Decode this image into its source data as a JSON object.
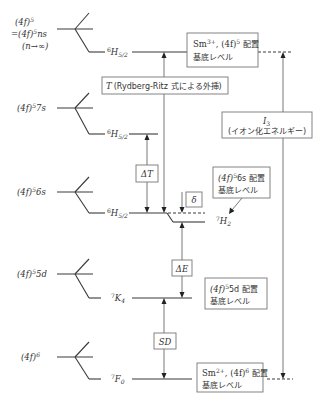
{
  "configs": {
    "limit": {
      "l1_base": "(4f)",
      "l1_sup": "5",
      "l2_base": "=(4f)",
      "l2_sup": "5",
      "l2_suffix": "ns",
      "l3": "(n→∞)"
    },
    "s7": {
      "base": "(4f)",
      "sup": "5",
      "suffix": "7s"
    },
    "s6": {
      "base": "(4f)",
      "sup": "5",
      "suffix": "6s"
    },
    "d5": {
      "base": "(4f)",
      "sup": "5",
      "suffix": "5d"
    },
    "f6": {
      "base": "(4f)",
      "sup": "6"
    }
  },
  "terms": {
    "top": {
      "mult": "6",
      "L": "H",
      "J": "5/2"
    },
    "s7": {
      "mult": "6",
      "L": "H",
      "J": "5/2"
    },
    "s6": {
      "mult": "6",
      "L": "H",
      "J": "5/2"
    },
    "h2": {
      "mult": "7",
      "L": "H",
      "J": "2"
    },
    "d5": {
      "mult": "7",
      "L": "K",
      "J": "4"
    },
    "f6": {
      "mult": "7",
      "L": "F",
      "J": "0"
    }
  },
  "boxes": {
    "sm3": {
      "ion": "Sm",
      "charge": "3+",
      "sep": ", (4f)",
      "sup": "5",
      "suffix": " 配置",
      "line2": "基底レベル"
    },
    "rydberg": {
      "symbol": "T",
      "text": "(Rydberg-Ritz 式による外挿)"
    },
    "ionization": {
      "symbol": "I",
      "sub": "3",
      "text": "(イオン化エネルギー)"
    },
    "s6": {
      "base": "(4f)",
      "sup": "5",
      "suffix": "6s 配置",
      "line2": "基底レベル"
    },
    "d5": {
      "base": "(4f)",
      "sup": "5",
      "suffix": "5d 配置",
      "line2": "基底レベル"
    },
    "sm2": {
      "ion": "Sm",
      "charge": "2+",
      "sep": ", (4f)",
      "sup": "6",
      "suffix": " 配置",
      "line2": "基底レベル"
    }
  },
  "intervals": {
    "delta_t": "ΔT",
    "delta": "δ",
    "delta_e": "ΔE",
    "sd": "SD"
  },
  "colors": {
    "line": "#3a3a3a",
    "box_border": "#777777",
    "text": "#333333",
    "background": "#ffffff"
  }
}
